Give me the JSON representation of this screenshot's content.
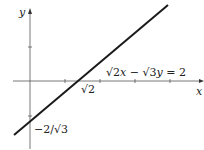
{
  "diagram": {
    "axes": {
      "x_label": "x",
      "y_label": "y"
    },
    "line": {
      "equation_parts": {
        "root2": "√2",
        "x": "x",
        "minus": " − ",
        "root3": "√3",
        "y": "y",
        "rhs": " = 2"
      },
      "x_intercept_label": "√2",
      "y_intercept_label": "−2/√3"
    },
    "colors": {
      "line": "#1a1a1a",
      "axis": "#555555"
    }
  }
}
